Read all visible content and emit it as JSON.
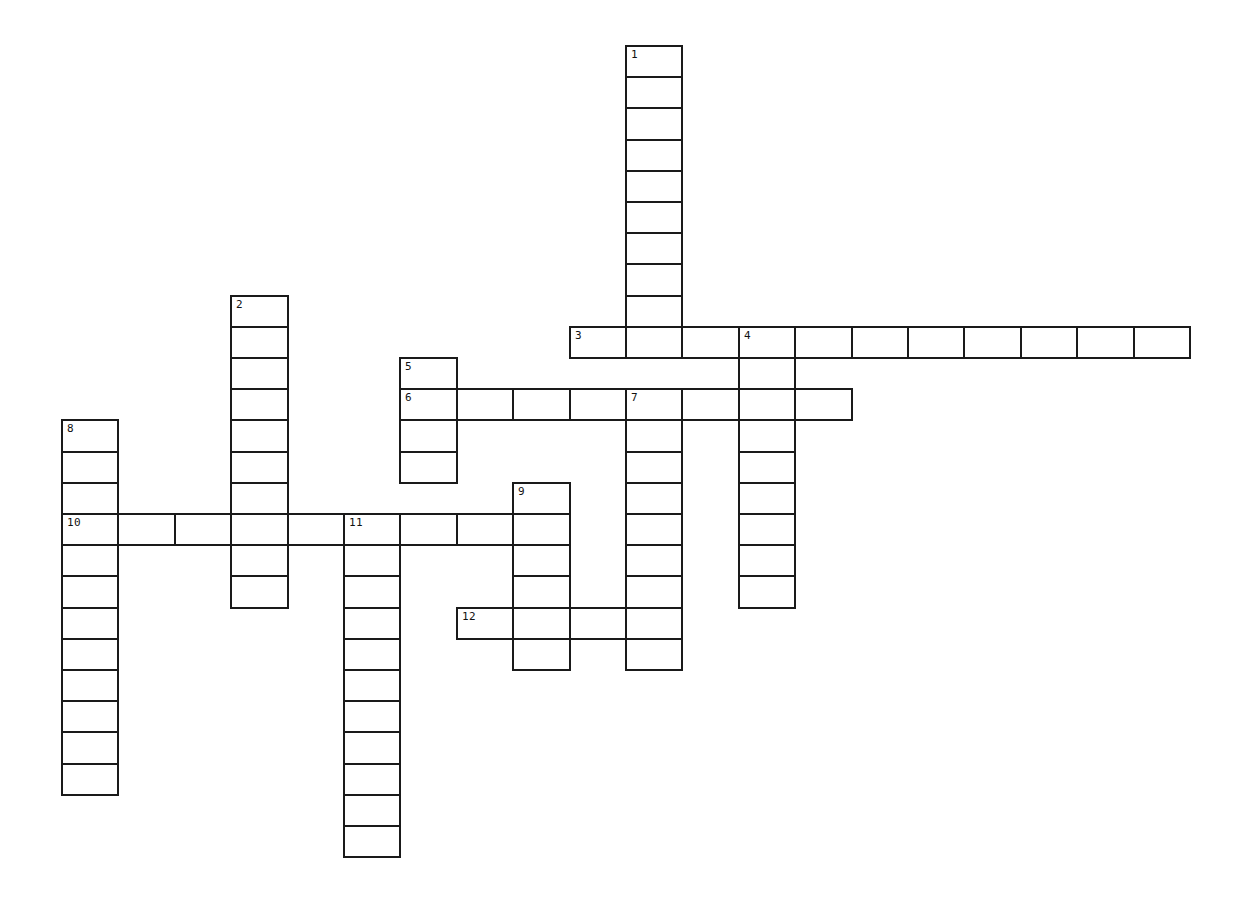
{
  "puzzle": {
    "cell_width": 56.4,
    "cell_height": 31.2,
    "origin_x": 61,
    "origin_y": 45,
    "line_color": "#1a1a1a",
    "background": "#ffffff",
    "clues": [
      {
        "number": "1",
        "direction": "down",
        "col": 10,
        "row": 0,
        "length": 10
      },
      {
        "number": "2",
        "direction": "down",
        "col": 3,
        "row": 8,
        "length": 10
      },
      {
        "number": "3",
        "direction": "across",
        "col": 9,
        "row": 9,
        "length": 11
      },
      {
        "number": "4",
        "direction": "down",
        "col": 12,
        "row": 9,
        "length": 9
      },
      {
        "number": "5",
        "direction": "down",
        "col": 6,
        "row": 10,
        "length": 4
      },
      {
        "number": "6",
        "direction": "across",
        "col": 6,
        "row": 11,
        "length": 8
      },
      {
        "number": "7",
        "direction": "down",
        "col": 10,
        "row": 11,
        "length": 9
      },
      {
        "number": "8",
        "direction": "down",
        "col": 0,
        "row": 12,
        "length": 12
      },
      {
        "number": "9",
        "direction": "down",
        "col": 8,
        "row": 14,
        "length": 6
      },
      {
        "number": "10",
        "direction": "across",
        "col": 0,
        "row": 15,
        "length": 9
      },
      {
        "number": "11",
        "direction": "down",
        "col": 5,
        "row": 15,
        "length": 11
      },
      {
        "number": "12",
        "direction": "across",
        "col": 7,
        "row": 18,
        "length": 4
      }
    ]
  }
}
